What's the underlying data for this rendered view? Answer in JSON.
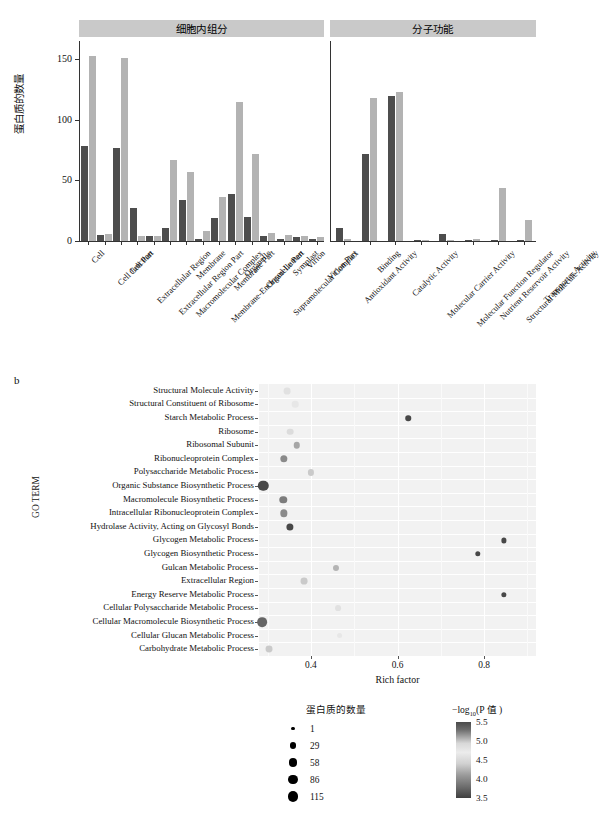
{
  "panel_a": {
    "panel_letter": "",
    "y_axis_label": "蛋白质的数量",
    "y_ticks": [
      0,
      50,
      100,
      150
    ],
    "y_max": 165,
    "facets": [
      {
        "name": "cellular-component",
        "title": "细胞内组分"
      },
      {
        "name": "molecular-function",
        "title": "分子功能"
      }
    ]
  },
  "chart_data": [
    {
      "type": "bar",
      "title": "GO annotation protein counts",
      "xlabel": "",
      "ylabel": "蛋白质的数量",
      "ylim": [
        0,
        165
      ],
      "yticks": [
        0,
        50,
        100,
        150
      ],
      "grid": false,
      "legend": "none",
      "facets": [
        {
          "facet": "细胞内组分",
          "categories": [
            "Cell",
            "Cell Junction",
            "Cell Part",
            "Extracellular Region",
            "Extracellular Region Part",
            "Macromolecular Complex",
            "Membrane",
            "Membrane-Enclosed Lumen",
            "Membrane Part",
            "Organelle",
            "Organelle Part",
            "Supramolecular Complex",
            "Symplast",
            "Virion",
            "Virion Part"
          ],
          "series": [
            {
              "name": "dark",
              "values": [
                78,
                5,
                77,
                27,
                4,
                11,
                34,
                2,
                19,
                39,
                20,
                4,
                2,
                3,
                2
              ]
            },
            {
              "name": "light",
              "values": [
                153,
                6,
                151,
                4,
                4,
                67,
                57,
                8,
                36,
                115,
                72,
                7,
                5,
                4,
                3
              ]
            }
          ]
        },
        {
          "facet": "分子功能",
          "categories": [
            "Antioxidant Activity",
            "Binding",
            "Catalytic Activity",
            "Molecular Carrier Activity",
            "Molecular Function Regulator",
            "Nutrient Reservoir Activity",
            "Structural Molecule Activity",
            "Transporter Activity"
          ],
          "series": [
            {
              "name": "dark",
              "values": [
                11,
                72,
                120,
                1,
                6,
                1,
                1,
                1
              ]
            },
            {
              "name": "light",
              "values": [
                2,
                118,
                123,
                1,
                1,
                2,
                44,
                17
              ]
            }
          ]
        }
      ],
      "colors": {
        "dark": "#4d4d4d",
        "light": "#b3b3b3"
      }
    },
    {
      "type": "scatter",
      "title": "",
      "xlabel": "Rich factor",
      "ylabel": "GO TERM",
      "xlim": [
        0.28,
        0.92
      ],
      "xticks": [
        0.4,
        0.6,
        0.8
      ],
      "xtick_labels": [
        "0.4",
        "0.6",
        "0.8"
      ],
      "grid": true,
      "legend": "right",
      "size_legend": {
        "title": "蛋白质的数量",
        "values": [
          1,
          29,
          58,
          86,
          115
        ]
      },
      "color_legend": {
        "title": "−log10(P 值)",
        "ticks": [
          5.5,
          5.0,
          4.5,
          4.0,
          3.5
        ]
      },
      "categories": [
        "Structural Molecule Activity",
        "Structural Constituent of Ribosome",
        "Starch Metabolic Process",
        "Ribosome",
        "Ribosomal Subunit",
        "Ribonucleoprotein Complex",
        "Polysaccharide Metabolic Process",
        "Organic Substance Biosynthetic Process",
        "Macromolecule Biosynthetic Process",
        "Intracellular Ribonucleoprotein Complex",
        "Hydrolase Activity, Acting on Glycosyl Bonds",
        "Glycogen Metabolic Process",
        "Glycogen Biosynthetic Process",
        "Gulcan Metabolic Process",
        "Extracellular Region",
        "Energy Reserve Metabolic Process",
        "Cellular Polysaccharide Metabolic Process",
        "Cellular Macromolecule Biosynthetic Process",
        "Cellular Glucan Metabolic Process",
        "Carbohydrate Metabolic Process"
      ],
      "points": [
        {
          "term": "Structural Molecule Activity",
          "rich_factor": 0.345,
          "count": 29,
          "neglog10p": 4.7
        },
        {
          "term": "Structural Constituent of Ribosome",
          "rich_factor": 0.363,
          "count": 26,
          "neglog10p": 4.8
        },
        {
          "term": "Starch Metabolic Process",
          "rich_factor": 0.625,
          "count": 12,
          "neglog10p": 3.6
        },
        {
          "term": "Ribosome",
          "rich_factor": 0.352,
          "count": 27,
          "neglog10p": 4.9
        },
        {
          "term": "Ribosomal Subunit",
          "rich_factor": 0.367,
          "count": 24,
          "neglog10p": 4.4
        },
        {
          "term": "Ribonucleoprotein Complex",
          "rich_factor": 0.337,
          "count": 38,
          "neglog10p": 4.2
        },
        {
          "term": "Polysaccharide Metabolic Process",
          "rich_factor": 0.4,
          "count": 20,
          "neglog10p": 4.6
        },
        {
          "term": "Organic Substance Biosynthetic Process",
          "rich_factor": 0.29,
          "count": 115,
          "neglog10p": 3.6
        },
        {
          "term": "Macromolecule Biosynthetic Process",
          "rich_factor": 0.336,
          "count": 40,
          "neglog10p": 4.1
        },
        {
          "term": "Intracellular Ribonucleoprotein Complex",
          "rich_factor": 0.337,
          "count": 38,
          "neglog10p": 4.2
        },
        {
          "term": "Hydrolase Activity, Acting on Glycosyl Bonds",
          "rich_factor": 0.352,
          "count": 36,
          "neglog10p": 3.6
        },
        {
          "term": "Glycogen Metabolic Process",
          "rich_factor": 0.845,
          "count": 9,
          "neglog10p": 3.6
        },
        {
          "term": "Glycogen Biosynthetic Process",
          "rich_factor": 0.785,
          "count": 11,
          "neglog10p": 3.6
        },
        {
          "term": "Gulcan Metabolic Process",
          "rich_factor": 0.458,
          "count": 18,
          "neglog10p": 4.5
        },
        {
          "term": "Extracellular Region",
          "rich_factor": 0.385,
          "count": 30,
          "neglog10p": 4.6
        },
        {
          "term": "Energy Reserve Metabolic Process",
          "rich_factor": 0.845,
          "count": 10,
          "neglog10p": 3.6
        },
        {
          "term": "Cellular Polysaccharide Metabolic Process",
          "rich_factor": 0.463,
          "count": 16,
          "neglog10p": 4.7
        },
        {
          "term": "Cellular Macromolecule Biosynthetic Process",
          "rich_factor": 0.288,
          "count": 95,
          "neglog10p": 3.9
        },
        {
          "term": "Cellular Glucan Metabolic Process",
          "rich_factor": 0.466,
          "count": 15,
          "neglog10p": 4.8
        },
        {
          "term": "Carbohydrate Metabolic Process",
          "rich_factor": 0.303,
          "count": 31,
          "neglog10p": 4.6
        }
      ]
    }
  ],
  "panel_b": {
    "panel_letter": "b",
    "y_axis_label": "GO TERM",
    "x_axis_label": "Rich factor",
    "size_legend_title": "蛋白质的数量",
    "color_legend_title_pre": "−log",
    "color_legend_title_sub": "10",
    "color_legend_title_post": "(P 值 )"
  }
}
